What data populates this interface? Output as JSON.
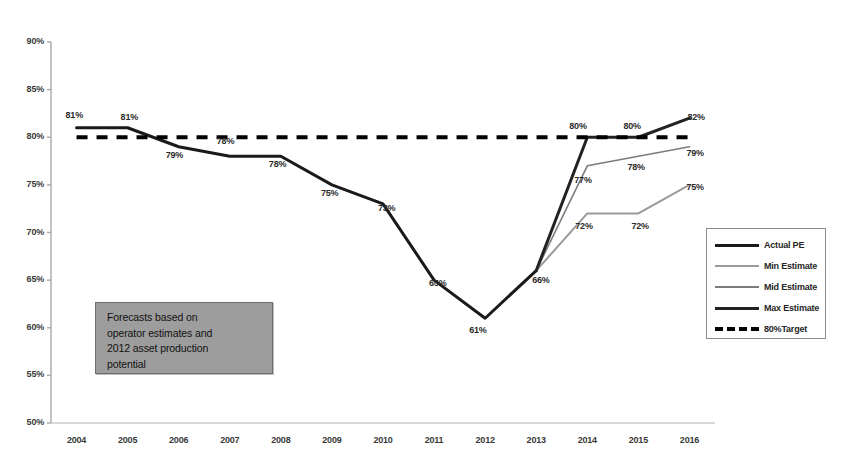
{
  "chart_data": {
    "type": "line",
    "title": "",
    "xlabel": "",
    "ylabel": "",
    "ylim": [
      50,
      90
    ],
    "ytick_step": 5,
    "grid": false,
    "legend_position": "right",
    "x": [
      "2004",
      "2005",
      "2006",
      "2007",
      "2008",
      "2009",
      "2010",
      "2011",
      "2012",
      "2013",
      "2014",
      "2015",
      "2016"
    ],
    "ytick_labels": [
      "90%",
      "85%",
      "80%",
      "75%",
      "70%",
      "65%",
      "60%",
      "55%",
      "50%"
    ],
    "ytick_values": [
      90,
      85,
      80,
      75,
      70,
      65,
      60,
      55,
      50
    ],
    "series": [
      {
        "name": "Actual PE",
        "color": "#1a1a1a",
        "width": 3.0,
        "dash": "solid",
        "values": [
          81,
          81,
          79,
          78,
          78,
          75,
          73,
          65,
          61,
          66,
          null,
          null,
          null
        ]
      },
      {
        "name": "Min Estimate",
        "color": "#9a9a9a",
        "width": 2.0,
        "dash": "solid",
        "values": [
          null,
          null,
          null,
          null,
          null,
          null,
          null,
          null,
          null,
          66,
          72,
          72,
          75
        ]
      },
      {
        "name": "Mid Estimate",
        "color": "#7c7c7c",
        "width": 1.6,
        "dash": "solid",
        "values": [
          null,
          null,
          null,
          null,
          null,
          null,
          null,
          null,
          null,
          66,
          77,
          78,
          79
        ]
      },
      {
        "name": "Max Estimate",
        "color": "#222222",
        "width": 3.0,
        "dash": "solid",
        "values": [
          null,
          null,
          null,
          null,
          null,
          null,
          null,
          null,
          null,
          66,
          80,
          80,
          82
        ]
      },
      {
        "name": "80%Target",
        "color": "#000000",
        "width": 4.0,
        "dash": "dashed",
        "values": [
          80,
          80,
          80,
          80,
          80,
          80,
          80,
          80,
          80,
          80,
          80,
          80,
          80
        ]
      }
    ],
    "point_labels": [
      {
        "text": "81%",
        "x": "2004",
        "y": 81,
        "dx": -2,
        "dy": -13
      },
      {
        "text": "81%",
        "x": "2005",
        "y": 81,
        "dx": 2,
        "dy": -11
      },
      {
        "text": "79%",
        "x": "2006",
        "y": 79,
        "dx": -4,
        "dy": 8
      },
      {
        "text": "78%",
        "x": "2007",
        "y": 78,
        "dx": -4,
        "dy": -15
      },
      {
        "text": "78%",
        "x": "2008",
        "y": 78,
        "dx": -3,
        "dy": 8
      },
      {
        "text": "75%",
        "x": "2009",
        "y": 75,
        "dx": -2,
        "dy": 8
      },
      {
        "text": "73%",
        "x": "2010",
        "y": 73,
        "dx": 4,
        "dy": 4
      },
      {
        "text": "65%",
        "x": "2011",
        "y": 65,
        "dx": 4,
        "dy": 3
      },
      {
        "text": "61%",
        "x": "2012",
        "y": 61,
        "dx": -7,
        "dy": 12
      },
      {
        "text": "66%",
        "x": "2013",
        "y": 66,
        "dx": 5,
        "dy": 9
      },
      {
        "text": "72%",
        "x": "2014",
        "y": 72,
        "dx": -3,
        "dy": 13
      },
      {
        "text": "72%",
        "x": "2015",
        "y": 72,
        "dx": 2,
        "dy": 13
      },
      {
        "text": "75%",
        "x": "2016",
        "y": 75,
        "dx": 6,
        "dy": 2
      },
      {
        "text": "77%",
        "x": "2014",
        "y": 77,
        "dx": -4,
        "dy": 14
      },
      {
        "text": "78%",
        "x": "2015",
        "y": 78,
        "dx": -2,
        "dy": 11
      },
      {
        "text": "79%",
        "x": "2016",
        "y": 79,
        "dx": 6,
        "dy": 6
      },
      {
        "text": "80%",
        "x": "2014",
        "y": 80,
        "dx": -9,
        "dy": -11
      },
      {
        "text": "80%",
        "x": "2015",
        "y": 80,
        "dx": -6,
        "dy": -11
      },
      {
        "text": "82%",
        "x": "2016",
        "y": 82,
        "dx": 7,
        "dy": -1
      }
    ]
  },
  "annotation": {
    "lines": [
      "Forecasts based on",
      "operator estimates and",
      "2012 asset production",
      "potential"
    ]
  },
  "legend": {
    "items": [
      {
        "label": "Actual PE"
      },
      {
        "label": "Min Estimate"
      },
      {
        "label": "Mid Estimate"
      },
      {
        "label": "Max Estimate"
      },
      {
        "label": "80%Target"
      }
    ]
  }
}
